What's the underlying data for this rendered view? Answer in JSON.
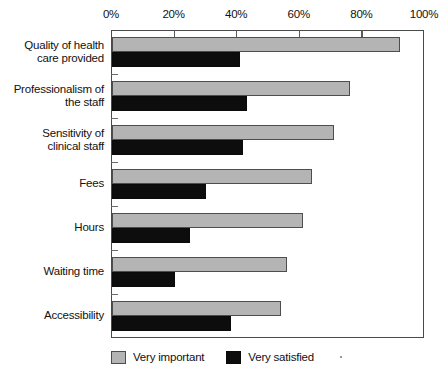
{
  "chart_data": {
    "type": "bar",
    "orientation": "horizontal",
    "title": "",
    "xlabel": "",
    "ylabel": "",
    "xlim": [
      0,
      100
    ],
    "xticks": [
      0,
      20,
      40,
      60,
      80,
      100
    ],
    "xtick_labels": [
      "0%",
      "20%",
      "40%",
      "60%",
      "80%",
      "100%"
    ],
    "grid": false,
    "legend_position": "bottom-left",
    "categories": [
      "Quality of health care provided",
      "Professionalism of the staff",
      "Sensitivity of clinical staff",
      "Fees",
      "Hours",
      "Waiting time",
      "Accessibility"
    ],
    "category_lines": [
      [
        "Quality of health",
        "care provided"
      ],
      [
        "Professionalism of",
        "the staff"
      ],
      [
        "Sensitivity of",
        "clinical staff"
      ],
      [
        "Fees"
      ],
      [
        "Hours"
      ],
      [
        "Waiting time"
      ],
      [
        "Accessibility"
      ]
    ],
    "series": [
      {
        "name": "Very important",
        "color": "#b4b4b4",
        "values": [
          92,
          76,
          71,
          64,
          61,
          56,
          54
        ]
      },
      {
        "name": "Very satisfied",
        "color": "#0d0d0d",
        "values": [
          41,
          43,
          42,
          30,
          25,
          20,
          38
        ]
      }
    ]
  },
  "legend": {
    "items": [
      {
        "label": "Very important"
      },
      {
        "label": "Very satisfied"
      }
    ]
  }
}
